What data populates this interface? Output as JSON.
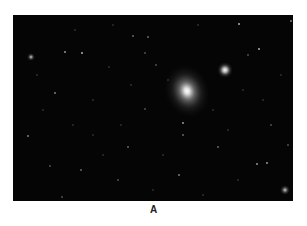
{
  "figure": {
    "caption": "A",
    "background": "#050505"
  },
  "objects": {
    "main_galaxy": {
      "cx": 174,
      "cy": 76,
      "rx": 22,
      "ry": 27,
      "color": "#ffffff"
    },
    "companion_galaxy": {
      "cx": 212,
      "cy": 55,
      "r": 8
    },
    "left_galaxy": {
      "cx": 18,
      "cy": 42,
      "r": 4
    },
    "corner_galaxy": {
      "cx": 272,
      "cy": 175,
      "r": 5
    }
  },
  "stars": [
    [
      52,
      37,
      0.9
    ],
    [
      69,
      38,
      1.0
    ],
    [
      42,
      78,
      0.8
    ],
    [
      15,
      121,
      0.8
    ],
    [
      120,
      21,
      0.7
    ],
    [
      135,
      22,
      0.7
    ],
    [
      132,
      38,
      0.6
    ],
    [
      143,
      50,
      0.6
    ],
    [
      226,
      9,
      1.0
    ],
    [
      246,
      34,
      1.0
    ],
    [
      278,
      6,
      0.8
    ],
    [
      235,
      40,
      0.6
    ],
    [
      170,
      108,
      0.9
    ],
    [
      170,
      120,
      0.7
    ],
    [
      205,
      132,
      0.7
    ],
    [
      244,
      149,
      0.9
    ],
    [
      254,
      148,
      0.9
    ],
    [
      166,
      160,
      0.8
    ],
    [
      68,
      155,
      0.7
    ],
    [
      37,
      151,
      0.6
    ],
    [
      115,
      132,
      0.7
    ],
    [
      49,
      182,
      0.6
    ],
    [
      132,
      94,
      0.6
    ],
    [
      96,
      52,
      0.5
    ],
    [
      80,
      85,
      0.5
    ],
    [
      108,
      110,
      0.5
    ],
    [
      200,
      95,
      0.5
    ],
    [
      230,
      75,
      0.5
    ],
    [
      258,
      110,
      0.6
    ],
    [
      268,
      60,
      0.5
    ],
    [
      24,
      60,
      0.5
    ],
    [
      90,
      140,
      0.5
    ],
    [
      150,
      140,
      0.5
    ],
    [
      190,
      180,
      0.5
    ],
    [
      225,
      165,
      0.5
    ],
    [
      60,
      110,
      0.5
    ],
    [
      140,
      175,
      0.5
    ],
    [
      105,
      165,
      0.6
    ],
    [
      185,
      10,
      0.5
    ],
    [
      100,
      10,
      0.5
    ],
    [
      62,
      15,
      0.5
    ],
    [
      30,
      95,
      0.5
    ],
    [
      250,
      85,
      0.5
    ],
    [
      275,
      130,
      0.6
    ],
    [
      215,
      115,
      0.5
    ],
    [
      155,
      65,
      0.5
    ],
    [
      118,
      70,
      0.5
    ],
    [
      80,
      120,
      0.5
    ]
  ]
}
